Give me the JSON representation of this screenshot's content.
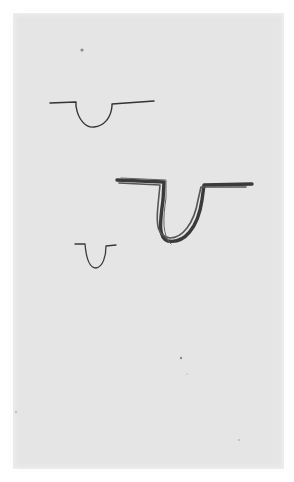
{
  "image": {
    "description": "Scanned sheet with three hand-drawn pencil sketches of U-shaped trough profiles",
    "paper_color": "#e5e5e5",
    "ink_color": "#2a2a2a"
  },
  "sketches": [
    {
      "name": "light-u-profile-top",
      "stroke": "light"
    },
    {
      "name": "bold-u-profile-middle",
      "stroke": "heavy"
    },
    {
      "name": "small-u-profile-bottom",
      "stroke": "light"
    }
  ]
}
